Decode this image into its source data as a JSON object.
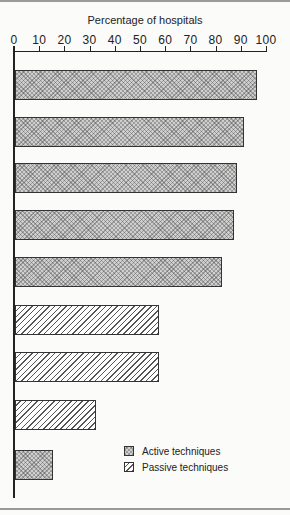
{
  "chart_data": {
    "type": "bar",
    "orientation": "horizontal",
    "title": "Percentage of hospitals",
    "xlabel": "Percentage of hospitals",
    "ylabel": "",
    "xlim": [
      0,
      100
    ],
    "x_ticks": [
      "0",
      "10",
      "20",
      "30",
      "40",
      "50",
      "60",
      "70",
      "80",
      "90",
      "100"
    ],
    "categories": [
      "",
      "",
      "",
      "",
      "",
      "",
      "",
      "",
      ""
    ],
    "values": [
      96,
      91,
      88,
      87,
      82,
      57,
      57,
      32,
      15
    ],
    "series_type": [
      "Active techniques",
      "Active techniques",
      "Active techniques",
      "Active techniques",
      "Active techniques",
      "Passive techniques",
      "Passive techniques",
      "Passive techniques",
      "Active techniques"
    ],
    "legend": [
      "Active techniques",
      "Passive techniques"
    ],
    "legend_position": "lower right",
    "grid": false
  },
  "legend": {
    "active": "Active techniques",
    "passive": "Passive techniques"
  }
}
